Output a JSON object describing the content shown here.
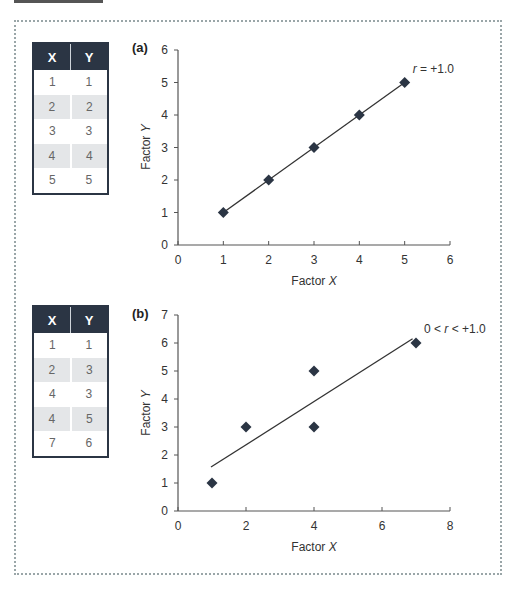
{
  "tables": [
    {
      "headers": [
        "X",
        "Y"
      ],
      "rows": [
        [
          "1",
          "1"
        ],
        [
          "2",
          "2"
        ],
        [
          "3",
          "3"
        ],
        [
          "4",
          "4"
        ],
        [
          "5",
          "5"
        ]
      ]
    },
    {
      "headers": [
        "X",
        "Y"
      ],
      "rows": [
        [
          "1",
          "1"
        ],
        [
          "2",
          "3"
        ],
        [
          "4",
          "3"
        ],
        [
          "4",
          "5"
        ],
        [
          "7",
          "6"
        ]
      ]
    }
  ],
  "chart_data": [
    {
      "type": "scatter",
      "panel_label": "(a)",
      "xlabel": "Factor X",
      "ylabel": "Factor Y",
      "x": [
        1,
        2,
        3,
        4,
        5
      ],
      "y": [
        1,
        2,
        3,
        4,
        5
      ],
      "xlim": [
        0,
        6
      ],
      "ylim": [
        0,
        6
      ],
      "xticks": [
        "0",
        "1",
        "2",
        "3",
        "4",
        "5",
        "6"
      ],
      "yticks": [
        "0",
        "1",
        "2",
        "3",
        "4",
        "5",
        "6"
      ],
      "trendline": {
        "x": [
          1,
          5
        ],
        "y": [
          1,
          5
        ]
      },
      "annotation": "r = +1.0",
      "marker": "diamond",
      "marker_color": "#2b3544",
      "grid": false
    },
    {
      "type": "scatter",
      "panel_label": "(b)",
      "xlabel": "Factor X",
      "ylabel": "Factor Y",
      "x": [
        1,
        2,
        4,
        4,
        7
      ],
      "y": [
        1,
        3,
        3,
        5,
        6
      ],
      "xlim": [
        0,
        8
      ],
      "ylim": [
        0,
        7
      ],
      "xticks": [
        "0",
        "2",
        "4",
        "6",
        "8"
      ],
      "yticks": [
        "0",
        "1",
        "2",
        "3",
        "4",
        "5",
        "6",
        "7"
      ],
      "trendline": {
        "x": [
          0.97,
          6.9
        ],
        "y": [
          1.57,
          6.15
        ]
      },
      "annotation": "0 < r < +1.0",
      "marker": "diamond",
      "marker_color": "#2b3544",
      "grid": false
    }
  ]
}
